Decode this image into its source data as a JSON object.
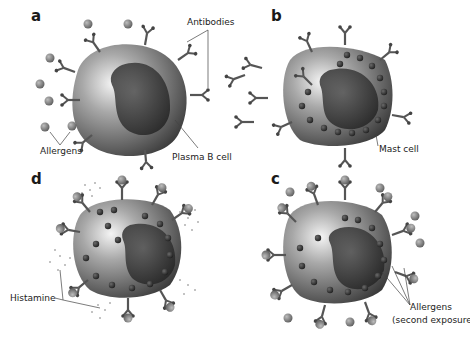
{
  "figure": {
    "panels": [
      {
        "id": "a",
        "letter": "a",
        "cell": "Plasma B cell",
        "labels": [
          "Antibodies",
          "Allergens",
          "Plasma B cell"
        ]
      },
      {
        "id": "b",
        "letter": "b",
        "cell": "Mast cell",
        "labels": [
          "Mast cell"
        ]
      },
      {
        "id": "c",
        "letter": "c",
        "cell": "Mast cell with bound allergens",
        "labels": [
          "Allergens",
          "(second exposure)"
        ]
      },
      {
        "id": "d",
        "letter": "d",
        "cell": "Degranulating mast cell",
        "labels": [
          "Histamine"
        ]
      }
    ],
    "labels": {
      "antibodies": "Antibodies",
      "allergens": "Allergens",
      "plasma_b_cell": "Plasma B cell",
      "mast_cell": "Mast cell",
      "histamine": "Histamine",
      "allergens_second_line1": "Allergens",
      "allergens_second_line2": "(second exposure)"
    },
    "colors": {
      "background": "#ffffff",
      "cell_light": "#d8d8d8",
      "cell_dark": "#4a4a4a",
      "nucleus": "#2e2e2e",
      "granule": "#3a3a3a",
      "antibody": "#5a5a5a",
      "allergen": "#8a8a8a",
      "leader_line": "#444444"
    }
  }
}
